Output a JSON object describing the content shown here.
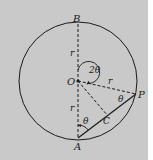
{
  "diagram": {
    "colors": {
      "background": "#c9c9c9",
      "stroke": "#1a1a1a",
      "margin": "#ffffff"
    },
    "points": {
      "B": "B",
      "O": "O",
      "P": "P",
      "C": "C",
      "A": "A"
    },
    "labels": {
      "r_top": "r",
      "r_bottom": "r",
      "r_op": "r",
      "angle_center": "2θ",
      "angle_at_p": "θ",
      "angle_at_a": "θ"
    }
  }
}
